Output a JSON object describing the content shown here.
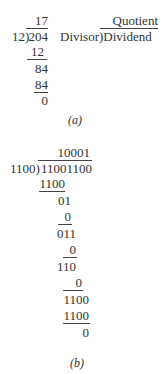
{
  "part_a": {
    "quotient": "17",
    "divisor": "12",
    "dividend": "204",
    "steps": [
      "12",
      "84",
      "84",
      "0"
    ],
    "legend": {
      "quotient": "Quotient",
      "divisor": "Divisor",
      "dividend": "Dividend"
    },
    "caption": "(a)"
  },
  "part_b": {
    "quotient": "10001",
    "divisor": "1100",
    "dividend": "11001100",
    "steps": [
      "1100",
      "01",
      "0",
      "011",
      "0",
      "110",
      "0",
      "1100",
      "1100",
      "0"
    ],
    "caption": "(b)"
  }
}
